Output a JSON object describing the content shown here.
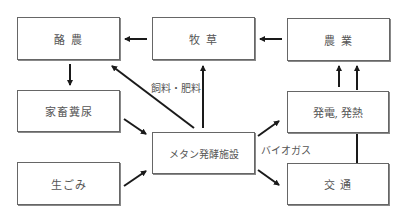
{
  "nodes": {
    "rakunou": "酪 農",
    "bokusou": "牧 草",
    "nougyou": "農 業",
    "kachiku_funnyou": "家畜糞尿",
    "namagomi": "生ごみ",
    "methane_facility": "メタン発酵施設",
    "hatsuden_hatsunetsu": "発電, 発熱",
    "koutsuu": "交 通"
  },
  "edge_labels": {
    "feed_fertilizer": "飼料・肥料",
    "biogas": "バイオガス"
  },
  "colors": {
    "line": "#1a1a1a",
    "box_border": "#666666",
    "text": "#555555"
  }
}
